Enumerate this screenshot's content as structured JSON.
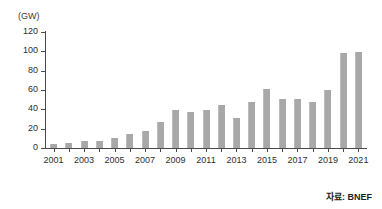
{
  "chart_data": {
    "type": "bar",
    "title": "",
    "subtitle": "",
    "unit_label": "(GW)",
    "xlabel": "",
    "ylabel": "",
    "ylim": [
      0,
      120
    ],
    "y_ticks": [
      0,
      20,
      40,
      60,
      80,
      100,
      120
    ],
    "grid": false,
    "legend": null,
    "source_note": "자료: BNEF",
    "x_tick_labels": [
      "2001",
      "2003",
      "2005",
      "2007",
      "2009",
      "2011",
      "2013",
      "2015",
      "2017",
      "2019",
      "2021"
    ],
    "categories": [
      "2001",
      "2002",
      "2003",
      "2004",
      "2005",
      "2006",
      "2007",
      "2008",
      "2009",
      "2010",
      "2011",
      "2012",
      "2013",
      "2014",
      "2015",
      "2016",
      "2017",
      "2018",
      "2019",
      "2020",
      "2021"
    ],
    "values": [
      4,
      5,
      7,
      7,
      10,
      15,
      18,
      27,
      39,
      37,
      39,
      44,
      31,
      48,
      61,
      51,
      51,
      48,
      60,
      98,
      99
    ],
    "bar_color": "#a8a8a8",
    "axis_color": "#4a4a4a",
    "text_color": "#2e2e2e"
  }
}
